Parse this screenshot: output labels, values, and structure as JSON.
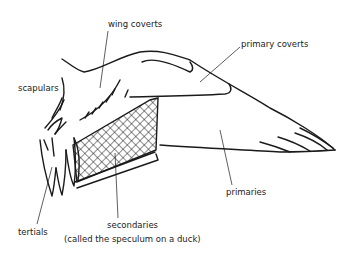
{
  "diagram": {
    "colors": {
      "ink": "#1a1a1a",
      "background": "#ffffff",
      "text": "#222222"
    },
    "labels": {
      "wing_coverts": "wing coverts",
      "primary_coverts": "primary coverts",
      "scapulars": "scapulars",
      "primaries": "primaries",
      "tertials": "tertials",
      "secondaries": "secondaries",
      "secondaries_note": "(called the speculum on a duck)"
    }
  }
}
